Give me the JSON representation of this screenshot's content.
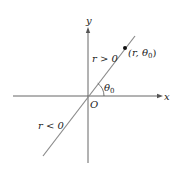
{
  "diagram": {
    "axes": {
      "x_label": "x",
      "y_label": "y",
      "origin_label": "O"
    },
    "line": {
      "positive_label": "r > 0",
      "negative_label": "r < 0",
      "color": "#8a8a8a"
    },
    "point": {
      "label": "(r, θ0)",
      "label_r": "(r, ",
      "label_theta": "θ",
      "label_sub": "0",
      "label_close": ")"
    },
    "angle": {
      "label_theta": "θ",
      "label_sub": "0"
    },
    "colors": {
      "axis": "#555555",
      "text": "#222222",
      "point": "#111111"
    }
  }
}
